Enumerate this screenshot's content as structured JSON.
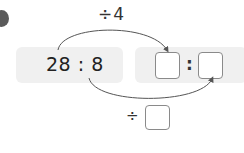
{
  "problem": {
    "bullet_icon": "problem-number-bullet",
    "top_operation": "÷4",
    "original_ratio": "28 : 8",
    "answer_separator": ":",
    "bottom_operator": "÷",
    "answer_blanks": {
      "first_term": "",
      "second_term": "",
      "bottom_divisor": ""
    }
  },
  "colors": {
    "panel_background": "#f0f0f0",
    "arrow_stroke": "#555555",
    "blank_border": "#8a8a8a",
    "bullet": "#5a5a5a"
  }
}
